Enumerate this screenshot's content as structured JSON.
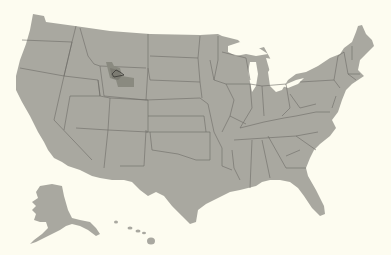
{
  "map": {
    "title": "United States",
    "projection": "Albers-like, with Alaska and Hawaii inset",
    "colors": {
      "background": "#fdfcf0",
      "land": "#a9a8a0",
      "state_border": "#6d6c66",
      "highlight_region": "#8a8a80",
      "highlight_core": "#7c7b72",
      "lake_outline": "#3f3e3a"
    },
    "highlighted_region": {
      "name": "Yellowstone area (northwest Wyoming)",
      "states": [
        "Wyoming",
        "Montana",
        "Idaho"
      ],
      "feature": "Yellowstone Lake outline"
    },
    "insets": [
      "Alaska",
      "Hawaii"
    ]
  }
}
